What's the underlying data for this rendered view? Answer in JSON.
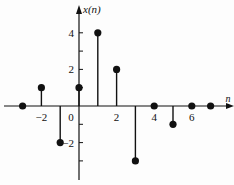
{
  "chart_data": {
    "type": "stem",
    "title": "",
    "xlabel": "n",
    "ylabel": "x(n)",
    "x": [
      -3,
      -2,
      -1,
      0,
      1,
      2,
      3,
      4,
      5,
      6,
      7
    ],
    "values": [
      0,
      1,
      -2,
      1,
      4,
      2,
      -3,
      0,
      -1,
      0,
      0
    ],
    "xticks": [
      -2,
      0,
      2,
      4,
      6
    ],
    "xtick_labels": [
      "−2",
      "0",
      "2",
      "4",
      "6"
    ],
    "yticks": [
      -3,
      -2,
      -1,
      1,
      2,
      3,
      4
    ],
    "ytick_labels_shown": {
      "4": "4",
      "2": "2",
      "-2": "−2"
    },
    "xlim": [
      -3.6,
      8.2
    ],
    "ylim": [
      -4,
      5.2
    ],
    "grid": false,
    "legend": null
  },
  "layout": {
    "origin_x": 79,
    "origin_y": 106,
    "px_per_unit_x": 18.8,
    "px_per_unit_y": 18.3,
    "axis_color": "#111111",
    "stem_color": "#111111"
  }
}
